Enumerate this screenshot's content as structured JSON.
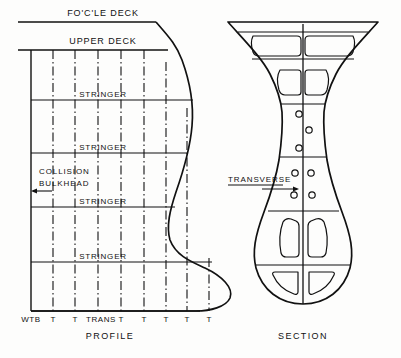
{
  "figure": {
    "title_profile": "PROFILE",
    "title_section": "SECTION",
    "ink_color": "#111111",
    "background_color": "#fdfdfc"
  },
  "profile": {
    "decks": [
      {
        "id": "focle-deck",
        "label": "FO'C'LE  DECK",
        "y": 22,
        "label_x": 103,
        "label_y": 16
      },
      {
        "id": "upper-deck",
        "label": "UPPER  DECK",
        "y": 50,
        "label_x": 103,
        "label_y": 44
      }
    ],
    "stringers": [
      {
        "label": "STRINGER",
        "y": 100,
        "label_x": 103,
        "label_y": 97
      },
      {
        "label": "STRINGER",
        "y": 153,
        "label_x": 103,
        "label_y": 150
      },
      {
        "label": "STRINGER",
        "y": 207,
        "label_x": 103,
        "label_y": 204
      },
      {
        "label": "STRINGER",
        "y": 262,
        "label_x": 103,
        "label_y": 259
      }
    ],
    "collision_bulkhead": {
      "line1": "COLLISION",
      "line2": "BULKHEAD",
      "line1_x": 39,
      "line1_y": 174,
      "line2_x": 39,
      "line2_y": 186,
      "arrow_y": 191,
      "arrow_from_x": 52,
      "arrow_to_x": 31
    },
    "baseline_y": 311,
    "frames": [
      {
        "label": "WTB",
        "x": 31,
        "type": "solid",
        "label_x": 31
      },
      {
        "label": "T",
        "x": 53,
        "type": "dash-dot",
        "label_x": 53
      },
      {
        "label": "T",
        "x": 75,
        "type": "dash-dot",
        "label_x": 75
      },
      {
        "label": "TRANS",
        "x": 98,
        "type": "dash-dot",
        "label_x": 101
      },
      {
        "label": "T",
        "x": 121,
        "type": "dash-dot",
        "label_x": 121
      },
      {
        "label": "T",
        "x": 144,
        "type": "dash-dot",
        "label_x": 144
      },
      {
        "label": "T",
        "x": 166,
        "type": "dash-dot",
        "label_x": 166
      },
      {
        "label": "T",
        "x": 187,
        "type": "dash-dot",
        "label_x": 187
      },
      {
        "label": "T",
        "x": 209,
        "type": "dash-dot",
        "label_x": 209
      }
    ],
    "frame_label_y": 322,
    "caption_x": 110,
    "caption_y": 339
  },
  "section": {
    "transverse_label": {
      "text": "TRANSVERSE",
      "x": 228,
      "y": 182,
      "underline_y": 185,
      "underline_from_x": 228,
      "underline_to_x": 283,
      "arrow_y": 189,
      "arrow_from_x": 283,
      "arrow_to_x": 300
    },
    "centerline_x": 303,
    "lightening_holes": [
      {
        "cx": 299,
        "cy": 114,
        "r": 3.2
      },
      {
        "cx": 309,
        "cy": 130,
        "r": 3.2
      },
      {
        "cx": 299,
        "cy": 148,
        "r": 3.2
      },
      {
        "cx": 295,
        "cy": 173,
        "r": 3.2
      },
      {
        "cx": 311,
        "cy": 173,
        "r": 3.2
      },
      {
        "cx": 294,
        "cy": 195,
        "r": 3.2
      },
      {
        "cx": 312,
        "cy": 195,
        "r": 3.2
      }
    ],
    "caption_x": 303,
    "caption_y": 339
  }
}
